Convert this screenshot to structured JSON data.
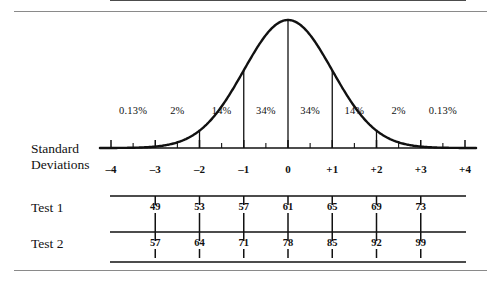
{
  "figure": {
    "ink_color": "#111111",
    "rule_color": "#8a8a8a"
  },
  "row_labels": {
    "standard_deviations_line1": "Standard",
    "standard_deviations_line2": "Deviations",
    "test1": "Test 1",
    "test2": "Test 2"
  },
  "chart_data": {
    "type": "line",
    "title": "",
    "xlabel": "Standard Deviations",
    "ylabel": "",
    "xlim": [
      -4,
      4
    ],
    "ylim": [
      0,
      1
    ],
    "grid": false,
    "legend": "none",
    "curve": "normal probability density",
    "standard_deviations": {
      "tick_values": [
        -4,
        -3,
        -2,
        -1,
        0,
        1,
        2,
        3,
        4
      ],
      "tick_labels": [
        "–4",
        "–3",
        "–2",
        "–1",
        "0",
        "+1",
        "+2",
        "+3",
        "+4"
      ]
    },
    "percent_bands": {
      "labels": [
        "0.13%",
        "2%",
        "14%",
        "34%",
        "34%",
        "14%",
        "2%",
        "0.13%"
      ],
      "values": [
        0.13,
        2,
        14,
        34,
        34,
        14,
        2,
        0.13
      ],
      "band_centers": [
        -3.5,
        -2.5,
        -1.5,
        -0.5,
        0.5,
        1.5,
        2.5,
        3.5
      ]
    },
    "series": [
      {
        "name": "Test 1",
        "sd_positions": [
          -3,
          -2,
          -1,
          0,
          1,
          2,
          3
        ],
        "values": [
          49,
          53,
          57,
          61,
          65,
          69,
          73
        ],
        "labels": [
          "49",
          "53",
          "57",
          "61",
          "65",
          "69",
          "73"
        ],
        "mean": 61,
        "sd_step": 4
      },
      {
        "name": "Test 2",
        "sd_positions": [
          -3,
          -2,
          -1,
          0,
          1,
          2,
          3
        ],
        "values": [
          57,
          64,
          71,
          78,
          85,
          92,
          99
        ],
        "labels": [
          "57",
          "64",
          "71",
          "78",
          "85",
          "92",
          "99"
        ],
        "mean": 78,
        "sd_step": 7
      }
    ],
    "drop_lines_at_sd": [
      -3,
      -2,
      -1,
      0,
      1,
      2,
      3
    ]
  }
}
